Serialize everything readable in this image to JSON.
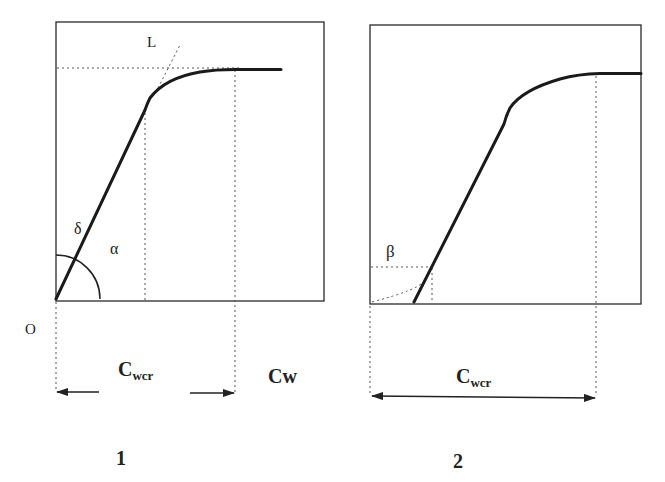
{
  "figure": {
    "panels": [
      {
        "id": "1",
        "caption": "1",
        "labels": {
          "origin": "O",
          "tangent": "L",
          "angle_delta": "δ",
          "angle_alpha": "α",
          "x_axis": "Cw",
          "critical_main": "C",
          "critical_sub": "wcr"
        }
      },
      {
        "id": "2",
        "caption": "2",
        "labels": {
          "angle_beta": "β",
          "critical_main": "C",
          "critical_sub": "wcr"
        }
      }
    ],
    "colors": {
      "curve": "#1a1a1a",
      "frame": "#2a2a2a",
      "dotted": "#555555",
      "background": "#ffffff"
    }
  }
}
